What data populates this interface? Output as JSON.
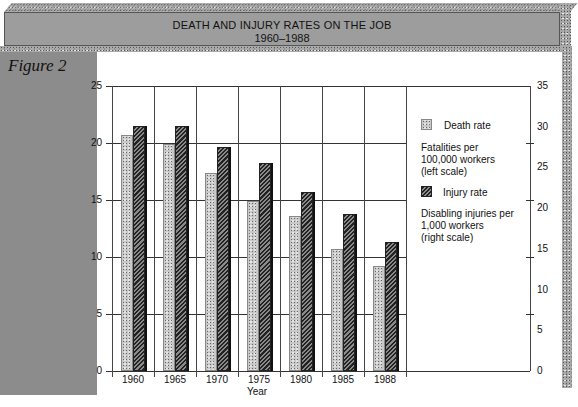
{
  "header": {
    "title": "DEATH AND INJURY RATES ON THE JOB",
    "subtitle": "1960–1988"
  },
  "figure_label": "Figure 2",
  "chart_data": {
    "type": "bar",
    "title": "DEATH AND INJURY RATES ON THE JOB 1960–1988",
    "xlabel": "Year",
    "categories": [
      "1960",
      "1965",
      "1970",
      "1975",
      "1980",
      "1985",
      "1988"
    ],
    "series": [
      {
        "name": "Death rate",
        "description": "Fatalities per 100,000 workers (left scale)",
        "axis": "left",
        "values": [
          20.7,
          19.9,
          17.4,
          14.9,
          13.6,
          10.7,
          9.2
        ]
      },
      {
        "name": "Injury rate",
        "description": "Disabling injuries per 1,000 workers (right scale)",
        "axis": "right",
        "values": [
          30.1,
          30.1,
          27.5,
          25.6,
          22.0,
          19.3,
          15.8
        ]
      }
    ],
    "left_axis": {
      "ylim": [
        0,
        25
      ],
      "ticks": [
        "0",
        "5",
        "10",
        "15",
        "20",
        "25"
      ]
    },
    "right_axis": {
      "ylim": [
        0,
        35
      ],
      "ticks": [
        "0",
        "5",
        "10",
        "15",
        "20",
        "25",
        "30",
        "35"
      ]
    },
    "grid": true,
    "legend_position": "right-inside"
  },
  "legend": {
    "death": {
      "label": "Death rate",
      "desc": [
        "Fatalities per",
        "100,000 workers",
        "(left scale)"
      ]
    },
    "injury": {
      "label": "Injury rate",
      "desc": [
        "Disabling injuries per",
        "1,000 workers",
        "(right scale)"
      ]
    }
  }
}
